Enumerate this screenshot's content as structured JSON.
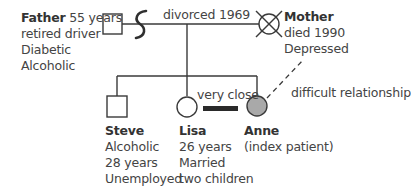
{
  "diagram": {
    "type": "genogram",
    "people": {
      "father": {
        "name": "Father",
        "lines": [
          "55 years",
          "retired driver",
          "Diabetic",
          "Alcoholic"
        ],
        "symbol": "square"
      },
      "mother": {
        "name": "Mother",
        "lines": [
          "died 1990",
          "Depressed"
        ],
        "symbol": "circle-crossed",
        "deceased": true
      },
      "steve": {
        "name": "Steve",
        "lines": [
          "Alcoholic",
          "28 years",
          "Unemployed"
        ],
        "symbol": "square"
      },
      "lisa": {
        "name": "Lisa",
        "lines": [
          "26 years",
          "Married",
          "two children"
        ],
        "symbol": "circle"
      },
      "anne": {
        "name": "Anne",
        "lines": [
          "(index patient)"
        ],
        "symbol": "circle-filled",
        "fill_color": "#a9a9a9"
      }
    },
    "relationships": {
      "marriage_label": "divorced 1969",
      "close_label": "very close",
      "difficult_label": "difficult relationship"
    },
    "colors": {
      "stroke": "#3a3a3a",
      "patient_fill": "#a9a9a9"
    }
  }
}
